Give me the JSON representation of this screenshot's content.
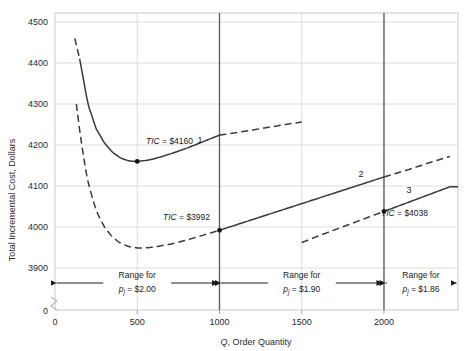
{
  "chart_data": {
    "type": "line",
    "title": "",
    "xlabel": "Q, Order Quantity",
    "ylabel": "Total Incremental Cost, Dollars",
    "xlim": [
      0,
      2450
    ],
    "ylim": [
      3850,
      4500
    ],
    "grid": true,
    "axis_break_y": true,
    "legend": "none",
    "xticks": [
      0,
      500,
      1000,
      1500,
      2000
    ],
    "xtick_labels": [
      "0",
      "500",
      "1000",
      "1500",
      "2000"
    ],
    "yticks": [
      3900,
      4000,
      4100,
      4200,
      4300,
      4400,
      4500
    ],
    "ytick_labels": [
      "3900",
      "4000",
      "4100",
      "4200",
      "4300",
      "4400",
      "4500"
    ],
    "y_zero_label": "0",
    "series": [
      {
        "name": "1",
        "price": "$2.00",
        "valid_range": [
          0,
          1000
        ],
        "label": "1",
        "solid_range": [
          150,
          1000
        ],
        "x": [
          120,
          150,
          200,
          250,
          300,
          350,
          400,
          450,
          500,
          550,
          600,
          700,
          800,
          900,
          1000,
          1100,
          1250,
          1400,
          1500
        ],
        "y": [
          4460,
          4410,
          4300,
          4240,
          4205,
          4182,
          4168,
          4161,
          4160,
          4162,
          4166,
          4178,
          4192,
          4208,
          4224,
          4230,
          4240,
          4250,
          4256
        ]
      },
      {
        "name": "2",
        "price": "$1.90",
        "valid_range": [
          1000,
          2000
        ],
        "label": "2",
        "solid_range": [
          1000,
          2000
        ],
        "x": [
          130,
          160,
          200,
          250,
          300,
          350,
          400,
          450,
          500,
          550,
          600,
          700,
          800,
          900,
          1000,
          1200,
          1400,
          1600,
          1800,
          2000,
          2150,
          2300,
          2400
        ],
        "y": [
          4300,
          4205,
          4110,
          4040,
          4000,
          3975,
          3960,
          3952,
          3949,
          3949,
          3951,
          3958,
          3968,
          3980,
          3992,
          4018,
          4044,
          4070,
          4096,
          4122,
          4140,
          4160,
          4172
        ]
      },
      {
        "name": "3",
        "price": "$1.86",
        "valid_range": [
          2000,
          2450
        ],
        "label": "3",
        "solid_range": [
          2000,
          2450
        ],
        "x": [
          1500,
          1600,
          1700,
          1800,
          1900,
          2000,
          2100,
          2200,
          2300,
          2400
        ],
        "y": [
          3962,
          3978,
          3993,
          4008,
          4023,
          4038,
          4053,
          4068,
          4083,
          4098
        ]
      }
    ],
    "annotations": [
      {
        "name": "tic-1",
        "text": "TIC = $4160",
        "point_x": 500,
        "point_y": 4160,
        "label_x": 620,
        "label_y": 4188
      },
      {
        "name": "tic-2",
        "text": "TIC = $3992",
        "point_x": 1000,
        "point_y": 3992,
        "label_x": 760,
        "label_y": 4022
      },
      {
        "name": "tic-3",
        "text": "TIC = $4038",
        "point_x": 2000,
        "point_y": 4038,
        "label_x": 2060,
        "label_y": 4028
      }
    ],
    "vlines": [
      1000,
      2000
    ],
    "range_bars": [
      {
        "name": "range-bar-1",
        "from": 0,
        "to": 1000,
        "line1": "Range for",
        "line2_prefix": "p",
        "line2_sub": "j",
        "line2_rest": " = $2.00"
      },
      {
        "name": "range-bar-2",
        "from": 1000,
        "to": 2000,
        "line1": "Range for",
        "line2_prefix": "p",
        "line2_sub": "j",
        "line2_rest": " = $1.90"
      },
      {
        "name": "range-bar-3",
        "from": 2000,
        "to": 2450,
        "line1": "Range for",
        "line2_prefix": "p",
        "line2_sub": "j",
        "line2_rest": " = $1.86"
      }
    ]
  },
  "axis": {
    "y_title": "Total Incremental Cost, Dollars",
    "x_title_italic": "Q",
    "x_title_rest": ", Order Quantity",
    "y_zero": "0",
    "x_zero": "0"
  },
  "ticks": {
    "y": [
      "4500",
      "4400",
      "4300",
      "4200",
      "4100",
      "4000",
      "3900"
    ],
    "x": [
      "0",
      "500",
      "1000",
      "1500",
      "2000"
    ]
  },
  "labels": {
    "curve1": "1",
    "curve2": "2",
    "curve3": "3",
    "tic1": "TIC = $4160",
    "tic2": "TIC = $3992",
    "tic3": "TIC = $4038",
    "tic_italic": "TIC",
    "tic1_value": " = $4160",
    "tic2_value": " = $3992",
    "tic3_value": " = $4038",
    "range_word": "Range for",
    "price1": " = $2.00",
    "price2": " = $1.90",
    "price3": " = $1.86",
    "price_symbol": "p",
    "price_subscript": "j"
  },
  "colors": {
    "curve": "#3a3a3a",
    "grid": "#d8d8d8",
    "frame": "#bdbdbd",
    "vline": "#5a5a5a",
    "text": "#1a1a1a"
  }
}
